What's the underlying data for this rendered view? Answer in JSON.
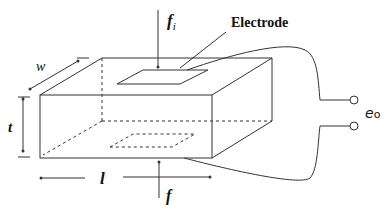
{
  "diagram": {
    "type": "piezoelectric-element",
    "labels": {
      "force_top": "f",
      "force_top_sub": "i",
      "force_bottom": "f",
      "electrode": "Electrode",
      "width": "w",
      "thickness": "t",
      "length": "l",
      "output_voltage": "e",
      "output_voltage_sub": "o"
    },
    "colors": {
      "line": "#333333",
      "background": "#ffffff"
    }
  }
}
